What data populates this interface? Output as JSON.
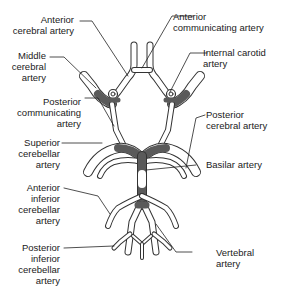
{
  "diagram": {
    "colors": {
      "vessel_fill": "#ffffff",
      "vessel_outline": "#333333",
      "shaded": "#5a5a5a",
      "leader": "#222222"
    },
    "labels_left": [
      {
        "id": "anterior-cerebral",
        "text": "Anterior\ncerebral artery"
      },
      {
        "id": "middle-cerebral",
        "text": "Middle\ncerebral\nartery"
      },
      {
        "id": "posterior-communicating",
        "text": "Posterior\ncommunicating\nartery"
      },
      {
        "id": "superior-cerebellar",
        "text": "Superior\ncerebellar\nartery"
      },
      {
        "id": "anterior-inferior-cerebellar",
        "text": "Anterior\ninferior\ncerebellar\nartery"
      },
      {
        "id": "posterior-inferior-cerebellar",
        "text": "Posterior\ninferior\ncerebellar\nartery"
      }
    ],
    "labels_right": [
      {
        "id": "anterior-communicating",
        "text": "Anterior\ncommunicating artery"
      },
      {
        "id": "internal-carotid",
        "text": "Internal carotid\nartery"
      },
      {
        "id": "posterior-cerebral",
        "text": "Posterior\ncerebral artery"
      },
      {
        "id": "basilar",
        "text": "Basilar artery"
      },
      {
        "id": "vertebral",
        "text": "Vertebral\nartery"
      }
    ]
  }
}
